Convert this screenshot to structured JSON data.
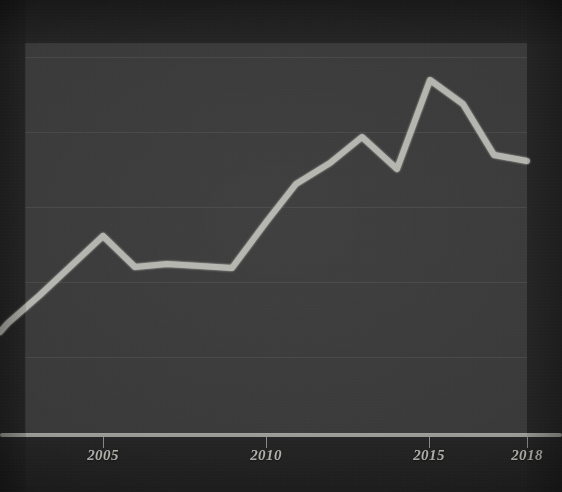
{
  "chart_data": {
    "type": "line",
    "title": "",
    "subtitle": "",
    "xlabel": "",
    "ylabel": "",
    "grid": true,
    "legend": false,
    "legend_position": "none",
    "xlim": [
      2002,
      2018
    ],
    "ylim": [
      0,
      5
    ],
    "x_tick_labels": [
      "2005",
      "2010",
      "2015",
      "2018"
    ],
    "x_tick_values": [
      2005,
      2010,
      2015,
      2018
    ],
    "y_tick_labels": [],
    "series": [
      {
        "name": "value",
        "color": "#c8c8c2",
        "x": [
          2002,
          2003,
          2004,
          2005,
          2006,
          2007,
          2008,
          2009,
          2010,
          2011,
          2012,
          2013,
          2014,
          2015,
          2016,
          2017,
          2018
        ],
        "values": [
          1.48,
          1.55,
          2.06,
          2.62,
          2.19,
          2.24,
          2.21,
          2.18,
          2.98,
          3.54,
          3.85,
          4.26,
          3.77,
          5.31,
          4.92,
          3.95,
          3.85
        ]
      }
    ],
    "annotations": []
  },
  "axis": {
    "x_axis_label_style": "italic-serif",
    "ticks": [
      {
        "label": "2005",
        "x_px": 103
      },
      {
        "label": "2010",
        "x_px": 266
      },
      {
        "label": "2015",
        "x_px": 429
      },
      {
        "label": "2018",
        "x_px": 527
      }
    ]
  },
  "colors": {
    "background": "#262626",
    "plot_background": "#3a3a3a",
    "line": "#c8c8c2",
    "axis": "#b9b9b5",
    "gridline": "rgba(255,255,255,0.075)",
    "tick_text": "#cfcfca"
  },
  "geometry": {
    "plot": {
      "left": 25,
      "top": 43,
      "width": 502,
      "height": 391
    },
    "gridlines_y_px": [
      57,
      132,
      207,
      282,
      357
    ],
    "axis_line_y_px": 434,
    "line_points_px": [
      [
        0,
        332
      ],
      [
        8,
        323
      ],
      [
        40,
        295
      ],
      [
        72,
        265
      ],
      [
        103,
        236
      ],
      [
        135,
        267
      ],
      [
        167,
        264
      ],
      [
        200,
        266
      ],
      [
        232,
        268
      ],
      [
        267,
        221
      ],
      [
        296,
        184
      ],
      [
        330,
        163
      ],
      [
        362,
        137
      ],
      [
        397,
        169
      ],
      [
        430,
        80
      ],
      [
        463,
        104
      ],
      [
        494,
        155
      ],
      [
        527,
        161
      ]
    ]
  }
}
